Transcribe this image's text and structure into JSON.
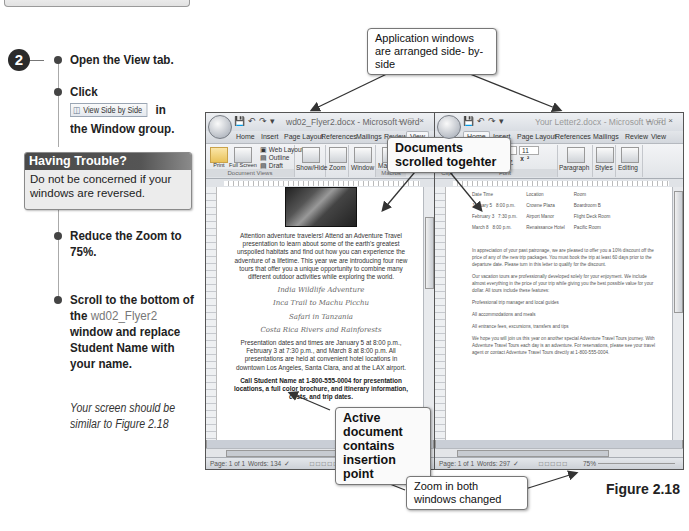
{
  "instructions": {
    "step_number": "2",
    "steps": [
      {
        "text": "Open the View tab."
      },
      {
        "text_before": "Click",
        "button_label": "View Side by Side",
        "text_after": "in",
        "text_line2": "the Window group."
      },
      {
        "text": "Reduce the Zoom to 75%."
      },
      {
        "text_before": "Scroll to the bottom of the",
        "file_name": "wd02_Flyer2",
        "text_after": "window and replace Student Name with your name."
      }
    ],
    "trouble_box": {
      "title": "Having Trouble?",
      "body": "Do not be concerned if your windows are reversed."
    },
    "note": "Your screen should be similar to Figure 2.18"
  },
  "callouts": {
    "arranged": "Application windows are arranged side- by- side",
    "scrolled": "Documents scrolled togehter",
    "active": "Active document contains insertion point",
    "zoom": "Zoom in both windows changed"
  },
  "left_window": {
    "title": "wd02_Flyer2.docx - Microsoft Word",
    "tabs": [
      "Home",
      "Insert",
      "Page Layout",
      "References",
      "Mailings",
      "Review",
      "View"
    ],
    "active_tab": "View",
    "ribbon": {
      "print_layout": "Print Layout",
      "full_screen": "Full Screen Reading",
      "web_layout": "Web Layout",
      "outline": "Outline",
      "draft": "Draft",
      "group_document_views": "Document Views",
      "show_hide": "Show/Hide",
      "zoom": "Zoom",
      "window": "Window",
      "macros": "Macros",
      "group_macros": "Macros"
    },
    "document": {
      "intro": "Attention adventure travelers! Attend an Adventure Travel presentation to learn about some of the earth's greatest unspoiled habitats and find out how you can experience the adventure of a lifetime. This year we are introducing four new tours that offer you a unique opportunity to combine many different outdoor activities while exploring the world.",
      "tours": [
        "India Wildlife Adventure",
        "Inca Trail to Machu Picchu",
        "Safari in Tanzania",
        "Costa Rica Rivers and Rainforests"
      ],
      "dates": "Presentation dates and times are January 5 at 8:00 p.m., February 3 at 7:30 p.m., and March 8 at 8:00 p.m. All presentations are held at convenient hotel locations in downtown Los Angeles, Santa Clara, and at the LAX airport.",
      "call": "Call Student Name at 1-800-555-0004 for presentation locations, a full color brochure, and itinerary information, costs, and trip dates."
    },
    "status": {
      "page": "Page: 1 of 1",
      "words": "Words: 134",
      "zoom": "75%"
    }
  },
  "right_window": {
    "title": "Your Letter2.docx - Microsoft Word",
    "tabs": [
      "Home",
      "Insert",
      "Page Layout",
      "References",
      "Mailings",
      "Review",
      "View"
    ],
    "active_tab": "Home",
    "ribbon": {
      "font_name": "Calibri (Body)",
      "font_size": "11",
      "paragraph": "Paragraph",
      "styles": "Styles",
      "editing": "Editing",
      "group_clipboard": "Clipboard",
      "group_font": "Font"
    },
    "document": {
      "table_headers": [
        "Date",
        "Time",
        "Location",
        "Room"
      ],
      "table_rows": [
        [
          "January 5",
          "8:00 p.m.",
          "Crowne Plaza",
          "Boardroom B"
        ],
        [
          "February 3",
          "7:30 p.m.",
          "Airport Manor",
          "Flight Deck Room"
        ],
        [
          "March 8",
          "8:00 p.m.",
          "Renaissance Hotel",
          "Pacific Room"
        ]
      ],
      "paragraphs": [
        "In appreciation of your past patronage, we are pleased to offer you a 10% discount off the price of any of the new trip packages. You must book the trip at least 60 days prior to the departure date. Please turn in this letter to qualify for the discount.",
        "Our vacation tours are professionally developed solely for your enjoyment. We include almost everything in the price of your trip while giving you the best possible value for your dollar. All tours include these features:",
        "Professional trip manager and local guides",
        "All accommodations and meals",
        "All entrance fees, excursions, transfers and tips",
        "We hope you will join us this year on another special Adventure Travel Tours journey. With Adventure Travel Tours each day is an adventure. For reservations, please see your travel agent or contact Adventure Travel Tours directly at 1-800-555-0004."
      ]
    },
    "status": {
      "page": "Page: 1 of 1",
      "words": "Words: 297",
      "zoom": "75%"
    }
  },
  "figure_label": "Figure 2.18"
}
